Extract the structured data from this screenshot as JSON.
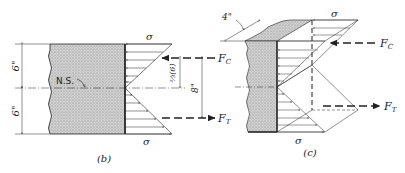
{
  "figure_b": {
    "caption": "(b)",
    "sigma_top": "σ",
    "sigma_bottom": "σ",
    "neutral_surface": "N.S.",
    "dim_top": "6\"",
    "dim_bottom": "6\"",
    "dim_lever_arm": "8\"",
    "dim_centroid": "⅔(6)",
    "force_compression": "F",
    "force_compression_sub": "C",
    "force_tension": "F",
    "force_tension_sub": "T"
  },
  "figure_c": {
    "caption": "(c)",
    "sigma_top": "σ",
    "sigma_bottom": "σ",
    "dim_width": "4\"",
    "force_compression": "F",
    "force_compression_sub": "C",
    "force_tension": "F",
    "force_tension_sub": "T"
  },
  "colors": {
    "ink": "#222222",
    "section_fill": "#c8c8c8"
  }
}
